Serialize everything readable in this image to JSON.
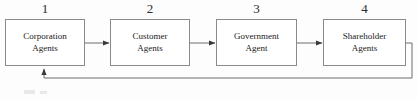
{
  "diagram": {
    "type": "flowchart",
    "nodes": [
      {
        "number": "1",
        "line1": "Corporation",
        "line2": "Agents",
        "x": 5,
        "y": 19,
        "w": 80,
        "h": 47
      },
      {
        "number": "2",
        "line1": "Customer",
        "line2": "Agents",
        "x": 110,
        "y": 19,
        "w": 80,
        "h": 47
      },
      {
        "number": "3",
        "line1": "Government",
        "line2": "Agent",
        "x": 216,
        "y": 19,
        "w": 81,
        "h": 47
      },
      {
        "number": "4",
        "line1": "Shareholder",
        "line2": "Agents",
        "x": 323,
        "y": 19,
        "w": 83,
        "h": 47
      }
    ],
    "connectors": [
      {
        "name": "arrow-node1-to-node2",
        "from": "1",
        "to": "2"
      },
      {
        "name": "arrow-node2-to-node3",
        "from": "2",
        "to": "3"
      },
      {
        "name": "arrow-node3-to-node4",
        "from": "3",
        "to": "4"
      },
      {
        "name": "feedback-arrow-node4-to-node1",
        "from": "4",
        "to": "1"
      }
    ],
    "colors": {
      "box_border": "#8a8a8a",
      "connector": "#6d6d6d",
      "text": "#1a1a1a",
      "number_text": "#2b2b2b",
      "background": "#fdfdfd"
    }
  }
}
